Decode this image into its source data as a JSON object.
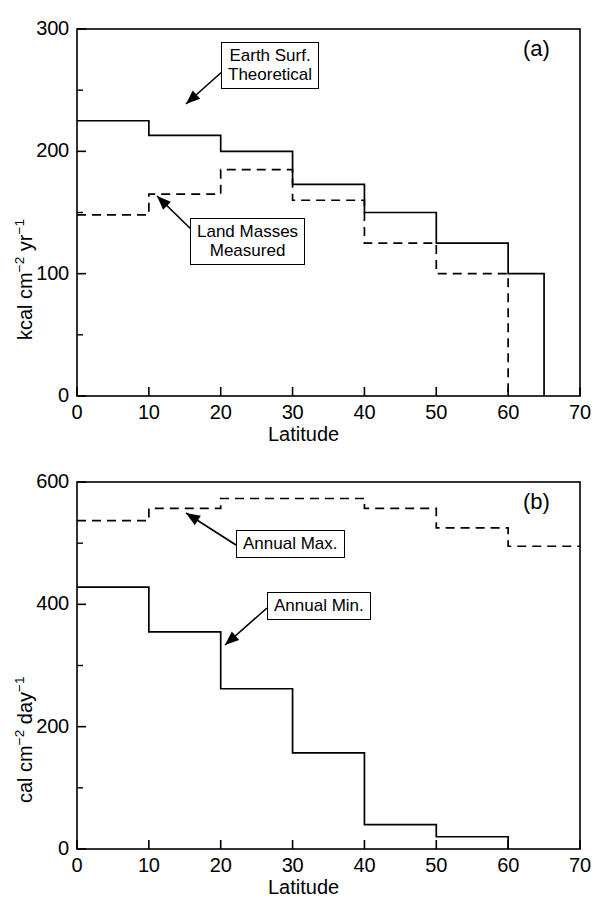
{
  "figure": {
    "background": "#ffffff",
    "ink_color": "#000000",
    "width": 602,
    "height": 906
  },
  "panels": [
    {
      "tag": "(a)",
      "xlabel": "Latitude",
      "ylabel_parts": {
        "pre": "kcal cm",
        "sup1": "−2",
        "mid": " yr",
        "sup2": "−1"
      },
      "ylabel_plain": "kcal cm-2 yr-1",
      "xticks": [
        "0",
        "10",
        "20",
        "30",
        "40",
        "50",
        "60",
        "70"
      ],
      "yticks": [
        "0",
        "100",
        "200",
        "300"
      ],
      "callouts": [
        {
          "line1": "Earth Surf.",
          "line2": "Theoretical"
        },
        {
          "line1": "Land Masses",
          "line2": "Measured"
        }
      ]
    },
    {
      "tag": "(b)",
      "xlabel": "Latitude",
      "ylabel_parts": {
        "pre": "cal cm",
        "sup1": "−2",
        "mid": " day",
        "sup2": "−1"
      },
      "ylabel_plain": "cal cm-2 day-1",
      "xticks": [
        "0",
        "10",
        "20",
        "30",
        "40",
        "50",
        "60",
        "70"
      ],
      "yticks": [
        "0",
        "200",
        "400",
        "600"
      ],
      "callouts": [
        {
          "line1": "Annual Max.",
          "line2": ""
        },
        {
          "line1": "Annual Min.",
          "line2": ""
        }
      ]
    }
  ],
  "chart_data": [
    {
      "type": "line",
      "style": "step",
      "title": "",
      "panel": "(a)",
      "xlabel": "Latitude",
      "ylabel": "kcal cm-2 yr-1",
      "xlim": [
        0,
        70
      ],
      "ylim": [
        0,
        300
      ],
      "xticks": [
        0,
        10,
        20,
        30,
        40,
        50,
        60,
        70
      ],
      "yticks": [
        0,
        100,
        200,
        300
      ],
      "yminorticks": [
        50,
        150,
        250
      ],
      "grid": false,
      "legend": "inline-callout",
      "x_bin_edges": [
        0,
        10,
        20,
        30,
        40,
        50,
        60,
        65
      ],
      "series": [
        {
          "name": "Earth Surf. Theoretical",
          "linestyle": "solid",
          "color": "#000000",
          "bin_edges": [
            0,
            10,
            20,
            30,
            40,
            50,
            60,
            65
          ],
          "values": [
            225,
            213,
            200,
            173,
            150,
            125,
            100
          ],
          "terminates_at_x": 65,
          "terminates_at_y": 0
        },
        {
          "name": "Land Masses Measured",
          "linestyle": "dashed",
          "color": "#000000",
          "bin_edges": [
            0,
            10,
            20,
            30,
            40,
            50,
            60
          ],
          "values": [
            148,
            165,
            185,
            160,
            125,
            100
          ],
          "terminates_at_x": 60,
          "terminates_at_y": 0
        }
      ]
    },
    {
      "type": "line",
      "style": "step",
      "title": "",
      "panel": "(b)",
      "xlabel": "Latitude",
      "ylabel": "cal cm-2 day-1",
      "xlim": [
        0,
        70
      ],
      "ylim": [
        0,
        600
      ],
      "xticks": [
        0,
        10,
        20,
        30,
        40,
        50,
        60,
        70
      ],
      "yticks": [
        0,
        200,
        400,
        600
      ],
      "yminorticks": [
        100,
        300,
        500
      ],
      "grid": false,
      "legend": "inline-callout",
      "x_bin_edges": [
        0,
        10,
        20,
        30,
        40,
        50,
        60,
        70
      ],
      "series": [
        {
          "name": "Annual Max.",
          "linestyle": "dashed",
          "color": "#000000",
          "bin_edges": [
            0,
            10,
            20,
            30,
            40,
            50,
            60,
            70
          ],
          "values": [
            537,
            557,
            573,
            573,
            557,
            525,
            495
          ],
          "terminates_at_x": 70,
          "terminates_at_y": 495
        },
        {
          "name": "Annual Min.",
          "linestyle": "solid",
          "color": "#000000",
          "bin_edges": [
            0,
            10,
            20,
            30,
            40,
            50,
            60
          ],
          "values": [
            428,
            355,
            262,
            157,
            40,
            20
          ],
          "terminates_at_x": 60,
          "terminates_at_y": 0
        }
      ]
    }
  ]
}
